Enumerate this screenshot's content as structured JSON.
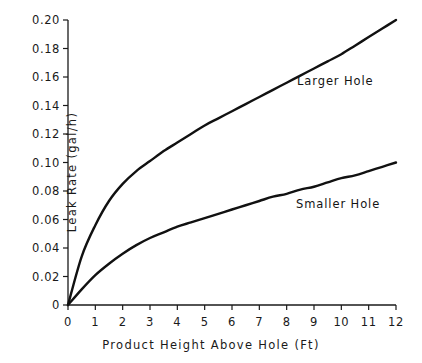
{
  "chart_data": {
    "type": "line",
    "title": "",
    "xlabel": "Product Height Above Hole (Ft)",
    "ylabel": "Leak Rate (gal/h)",
    "xlim": [
      0,
      12
    ],
    "ylim": [
      0,
      0.2
    ],
    "grid": false,
    "legend_position": "inline-annotation",
    "xticks": [
      0,
      1,
      2,
      3,
      4,
      5,
      6,
      7,
      8,
      9,
      10,
      11,
      12
    ],
    "xtick_labels": [
      "0",
      "1",
      "2",
      "3",
      "4",
      "5",
      "6",
      "7",
      "8",
      "9",
      "10",
      "11",
      "12"
    ],
    "yticks": [
      0,
      0.02,
      0.04,
      0.06,
      0.08,
      0.1,
      0.12,
      0.14,
      0.16,
      0.18,
      0.2
    ],
    "ytick_labels": [
      "0",
      "0.02",
      "0.04",
      "0.06",
      "0.08",
      "0.10",
      "0.12",
      "0.14",
      "0.16",
      "0.18",
      "0.20"
    ],
    "x": [
      0,
      0.5,
      1,
      1.5,
      2,
      2.5,
      3,
      3.5,
      4,
      4.5,
      5,
      5.5,
      6,
      6.5,
      7,
      7.5,
      8,
      8.5,
      9,
      9.5,
      10,
      10.5,
      11,
      11.5,
      12
    ],
    "series": [
      {
        "name": "Larger Hole",
        "color": "#111111",
        "values": [
          0.0,
          0.034,
          0.056,
          0.073,
          0.085,
          0.094,
          0.101,
          0.108,
          0.114,
          0.12,
          0.126,
          0.131,
          0.136,
          0.141,
          0.146,
          0.151,
          0.156,
          0.161,
          0.166,
          0.171,
          0.176,
          0.182,
          0.188,
          0.194,
          0.2
        ],
        "annotation": "Larger Hole"
      },
      {
        "name": "Smaller Hole",
        "color": "#111111",
        "values": [
          0.0,
          0.011,
          0.021,
          0.029,
          0.036,
          0.042,
          0.047,
          0.051,
          0.055,
          0.058,
          0.061,
          0.064,
          0.067,
          0.07,
          0.073,
          0.076,
          0.078,
          0.081,
          0.083,
          0.086,
          0.089,
          0.091,
          0.094,
          0.097,
          0.1
        ],
        "annotation": "Smaller Hole"
      }
    ]
  },
  "axes": {
    "x_title": "Product Height Above Hole (Ft)",
    "y_title": "Leak Rate (gal/h)"
  },
  "annotations": {
    "larger_hole": "Larger Hole",
    "smaller_hole": "Smaller Hole"
  }
}
